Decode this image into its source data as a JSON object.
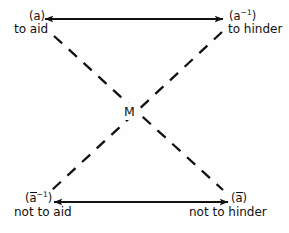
{
  "diagram": {
    "background_color": "#fefefe",
    "ink_color": "#111111",
    "center": {
      "label": "M",
      "name": "center-node-m"
    },
    "nodes": [
      {
        "id": "top-left",
        "symbol_base": "a",
        "symbol_display": "(a)",
        "has_overbar": false,
        "has_inverse": false,
        "gloss": "to aid"
      },
      {
        "id": "top-right",
        "symbol_base": "a",
        "symbol_display": "(a⁻¹)",
        "has_overbar": false,
        "has_inverse": true,
        "gloss": "to hinder"
      },
      {
        "id": "bottom-left",
        "symbol_base": "a",
        "symbol_display": "(ā⁻¹)",
        "has_overbar": true,
        "has_inverse": true,
        "gloss": "not to aid"
      },
      {
        "id": "bottom-right",
        "symbol_base": "a",
        "symbol_display": "(ā)",
        "has_overbar": true,
        "has_inverse": false,
        "gloss": "not to hinder"
      }
    ],
    "edges": [
      {
        "id": "top-edge",
        "from": "top-left",
        "to": "top-right",
        "style": "solid",
        "arrowheads": "both",
        "x1": 45,
        "y1": 19,
        "x2": 223,
        "y2": 19
      },
      {
        "id": "bottom-edge",
        "from": "bottom-left",
        "to": "bottom-right",
        "style": "solid",
        "arrowheads": "both",
        "x1": 54,
        "y1": 202,
        "x2": 228,
        "y2": 202
      },
      {
        "id": "diagonal-tl-br",
        "from": "top-left",
        "to": "bottom-right",
        "style": "dashed",
        "arrowheads": "none",
        "x1": 54,
        "y1": 36,
        "x2": 223,
        "y2": 190
      },
      {
        "id": "diagonal-tr-bl",
        "from": "top-right",
        "to": "bottom-left",
        "style": "dashed",
        "arrowheads": "none",
        "x1": 222,
        "y1": 32,
        "x2": 52,
        "y2": 190
      }
    ],
    "stroke": {
      "solid_width": 2.0,
      "dashed_width": 2.3,
      "dash_pattern": "11 9"
    }
  }
}
